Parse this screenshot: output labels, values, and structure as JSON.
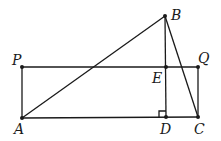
{
  "diagram": {
    "points": {
      "A": {
        "x": 22,
        "y": 118,
        "label": "A",
        "lx": 14,
        "ly": 134
      },
      "B": {
        "x": 165,
        "y": 16,
        "label": "B",
        "lx": 171,
        "ly": 20
      },
      "C": {
        "x": 198,
        "y": 117,
        "label": "C",
        "lx": 194,
        "ly": 134
      },
      "D": {
        "x": 166,
        "y": 117,
        "label": "D",
        "lx": 160,
        "ly": 134
      },
      "E": {
        "x": 166,
        "y": 67,
        "label": "E",
        "lx": 152,
        "ly": 83
      },
      "P": {
        "x": 22,
        "y": 67,
        "label": "P",
        "lx": 12,
        "ly": 65
      },
      "Q": {
        "x": 198,
        "y": 67,
        "label": "Q",
        "lx": 198,
        "ly": 63
      }
    },
    "segments": [
      "AB",
      "BC",
      "BD",
      "PQ",
      "AC",
      "AP",
      "QC"
    ],
    "right_angle_marker": "D"
  }
}
